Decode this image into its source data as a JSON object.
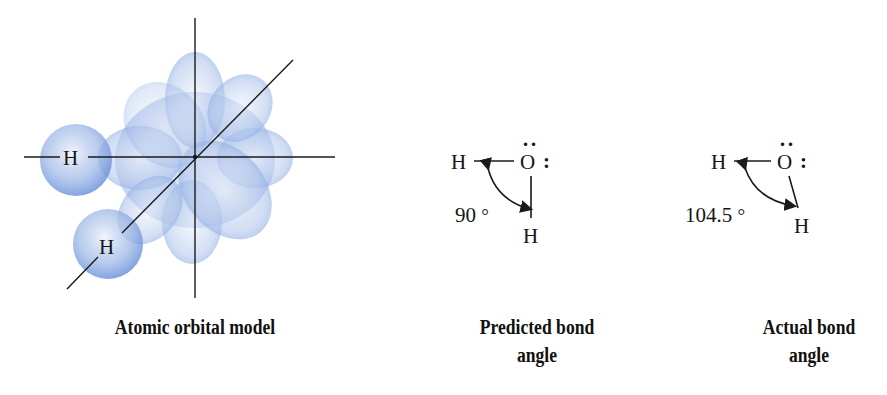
{
  "panels": [
    {
      "id": "atomic-orbital-model",
      "caption": "Atomic orbital model",
      "atom_labels": [
        "H",
        "H"
      ]
    },
    {
      "id": "predicted-bond-angle",
      "caption_line1": "Predicted bond",
      "caption_line2": "angle",
      "left_atom": "H",
      "center_atom": "O",
      "bottom_atom": "H",
      "lone_pair_top": "··",
      "lone_pair_right": ":",
      "angle": "90",
      "degree_symbol": "°"
    },
    {
      "id": "actual-bond-angle",
      "caption_line1": "Actual bond",
      "caption_line2": "angle",
      "left_atom": "H",
      "center_atom": "O",
      "bottom_atom": "H",
      "lone_pair_top": "··",
      "lone_pair_right": ":",
      "angle": "104.5",
      "degree_symbol": "°"
    }
  ],
  "colors": {
    "orbital_fill": "#5b86d6",
    "orbital_light": "#dfe8f7",
    "line": "#1a1a1a",
    "text": "#151515"
  }
}
